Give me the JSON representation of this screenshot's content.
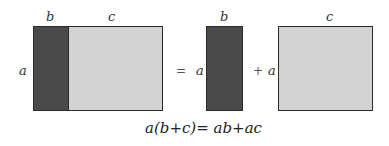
{
  "labels": {
    "left_b": "b",
    "left_c": "c",
    "left_a": "a",
    "mid_b": "b",
    "mid_a": "a",
    "right_c": "c",
    "right_a": "a"
  },
  "operators": {
    "equals": "=",
    "plus": "+"
  },
  "equation": "a(b+c)= ab+ac",
  "colors": {
    "dark_fill": "#4a4a4a",
    "light_fill": "#d3d3d3",
    "border": "#2a2a2a"
  }
}
